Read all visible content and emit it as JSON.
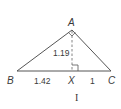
{
  "diagram": {
    "vertices": {
      "A": {
        "label": "A",
        "x": 72,
        "y": 30
      },
      "B": {
        "label": "B",
        "x": 17,
        "y": 71
      },
      "C": {
        "label": "C",
        "x": 111,
        "y": 71
      },
      "X": {
        "label": "X",
        "x": 72,
        "y": 71
      }
    },
    "measurements": {
      "altitude_AX": "1.19",
      "segment_BX": "1.42",
      "segment_XC": "1"
    },
    "caption": "I",
    "colors": {
      "stroke": "#555555",
      "text": "#3a3a3a"
    }
  }
}
